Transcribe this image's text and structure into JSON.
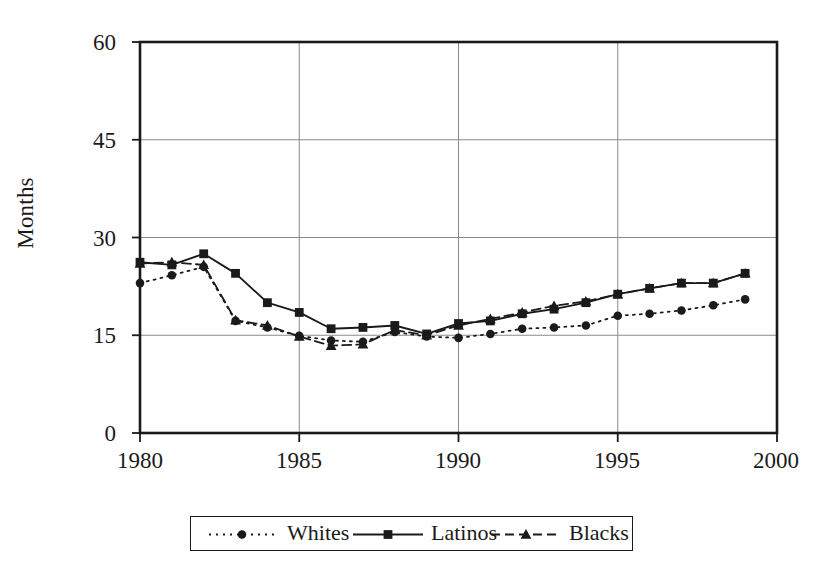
{
  "chart_data": {
    "type": "line",
    "title": "",
    "xlabel": "",
    "ylabel": "Months",
    "xlim": [
      1980,
      2000
    ],
    "ylim": [
      0,
      60
    ],
    "yticks": [
      0,
      15,
      30,
      45,
      60
    ],
    "xticks": [
      1980,
      1985,
      1990,
      1995,
      2000
    ],
    "grid": "horizontal-and-vertical",
    "legend_position": "bottom-center",
    "x": [
      1980,
      1981,
      1982,
      1983,
      1984,
      1985,
      1986,
      1987,
      1988,
      1989,
      1990,
      1991,
      1992,
      1993,
      1994,
      1995,
      1996,
      1997,
      1998,
      1999
    ],
    "series": [
      {
        "name": "Whites",
        "marker": "circle",
        "line_style": "dotted",
        "values": [
          23.0,
          24.2,
          25.5,
          17.2,
          16.2,
          14.9,
          14.2,
          14.0,
          15.5,
          14.8,
          14.6,
          15.2,
          16.0,
          16.2,
          16.5,
          18.0,
          18.3,
          18.8,
          19.6,
          20.5
        ]
      },
      {
        "name": "Latinos",
        "marker": "square",
        "line_style": "solid",
        "values": [
          26.2,
          25.8,
          27.5,
          24.5,
          20.0,
          18.5,
          16.0,
          16.2,
          16.5,
          15.2,
          16.8,
          17.2,
          18.3,
          19.0,
          20.0,
          21.3,
          22.2,
          23.0,
          23.0,
          24.5
        ]
      },
      {
        "name": "Blacks",
        "marker": "triangle",
        "line_style": "dashed",
        "values": [
          26.0,
          26.2,
          25.8,
          17.3,
          16.5,
          14.8,
          13.4,
          13.6,
          15.8,
          15.0,
          16.5,
          17.5,
          18.5,
          19.5,
          20.2,
          21.3,
          22.2,
          23.0,
          23.0,
          24.5
        ]
      }
    ]
  },
  "axes": {
    "ylabel": "Months",
    "ytick_labels": [
      "60",
      "45",
      "30",
      "15",
      "0"
    ],
    "xtick_labels": [
      "1980",
      "1985",
      "1990",
      "1995",
      "2000"
    ]
  },
  "legend": {
    "entries": [
      {
        "label": "Whites",
        "marker": "circle-marker",
        "style": "dotted"
      },
      {
        "label": "Latinos",
        "marker": "square-marker",
        "style": "solid"
      },
      {
        "label": "Blacks",
        "marker": "triangle-marker",
        "style": "dashed"
      }
    ]
  },
  "colors": {
    "ink": "#1a1a1a",
    "grid": "#8a8a8a",
    "background": "#ffffff"
  }
}
